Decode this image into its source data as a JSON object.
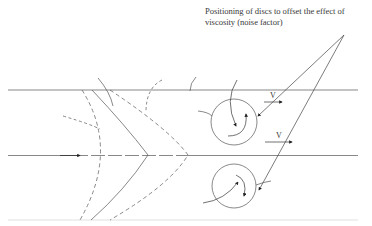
{
  "caption": {
    "line1": "Positioning of discs to offset the effect of",
    "line2": "viscosity (noise factor)"
  },
  "labels": {
    "velocity_upper": "V",
    "velocity_lower": "V"
  },
  "elements": {
    "channel_walls": [
      "top-wall",
      "centerline",
      "bottom-wall"
    ],
    "wave_fronts": [
      "dashed-front-left",
      "solid-front",
      "dashed-front-right"
    ],
    "discs": [
      "upper-disc",
      "lower-disc"
    ]
  },
  "colors": {
    "line": "#555555",
    "bottom_wall": "#d8d8d8",
    "text": "#3a3a3a"
  }
}
